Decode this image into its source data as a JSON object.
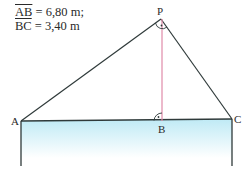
{
  "given": [
    {
      "segment": "AB",
      "value": "= 6,80 m;"
    },
    {
      "segment": "BC",
      "value": "= 3,40 m"
    }
  ],
  "points": {
    "P": {
      "label": "P",
      "x": 161,
      "y": 19
    },
    "A": {
      "label": "A",
      "x": 21,
      "y": 121
    },
    "B": {
      "label": "B",
      "x": 162,
      "y": 121
    },
    "C": {
      "label": "C",
      "x": 232,
      "y": 119
    }
  },
  "colors": {
    "lines": "#2f3a3a",
    "height_line": "#e08aa8",
    "water_top": "#bfeaf5",
    "water_bottom": "#ffffff"
  }
}
